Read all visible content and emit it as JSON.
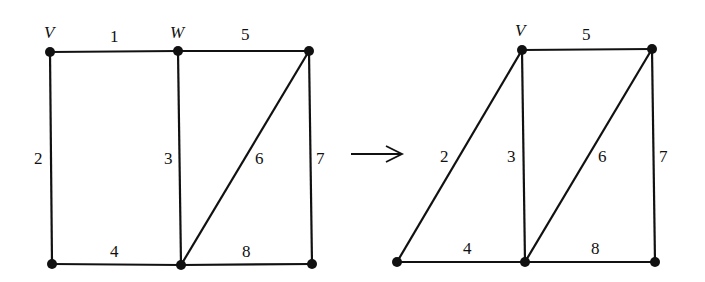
{
  "diagram": {
    "type": "graph-transformation",
    "before": {
      "vertex_labels": {
        "v1": "V",
        "v2": "W"
      },
      "edge_labels": {
        "e1": "1",
        "e2": "2",
        "e3": "3",
        "e4": "4",
        "e5": "5",
        "e6": "6",
        "e7": "7",
        "e8": "8"
      }
    },
    "arrow": {
      "symbol": "→"
    },
    "after": {
      "vertex_labels": {
        "v1": "V"
      },
      "edge_labels": {
        "e2": "2",
        "e3": "3",
        "e4": "4",
        "e5": "5",
        "e6": "6",
        "e7": "7",
        "e8": "8"
      }
    }
  }
}
